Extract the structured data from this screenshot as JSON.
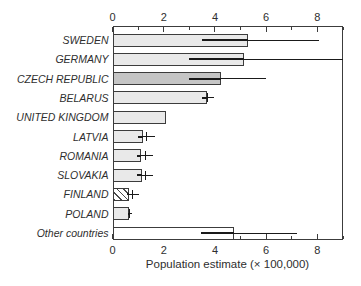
{
  "figure": {
    "background": "#ffffff"
  },
  "chart_data": {
    "type": "bar",
    "orientation": "horizontal",
    "title": "",
    "xlabel": "Population estimate (× 100,000)",
    "xlim": [
      0,
      9
    ],
    "xticks_major": [
      0,
      2,
      4,
      6,
      8
    ],
    "xticks_minor": [
      1,
      3,
      5,
      7,
      9
    ],
    "grid": false,
    "legend": "none",
    "axis_style": "full box, tick marks inside on top and bottom axes, tick labels on both top and bottom",
    "categories": [
      "SWEDEN",
      "GERMANY",
      "CZECH REPUBLIC",
      "BELARUS",
      "UNITED KINGDOM",
      "LATVIA",
      "ROMANIA",
      "SLOVAKIA",
      "FINLAND",
      "POLAND",
      "Other countries"
    ],
    "values": [
      5.3,
      5.15,
      4.25,
      3.7,
      2.1,
      1.2,
      1.1,
      1.15,
      0.65,
      0.65,
      4.75
    ],
    "error_low": [
      3.5,
      3.0,
      3.0,
      3.5,
      null,
      1.0,
      0.95,
      0.95,
      0.55,
      0.6,
      3.45
    ],
    "error_high": [
      8.05,
      9.0,
      6.0,
      3.95,
      null,
      1.65,
      1.6,
      1.6,
      1.05,
      0.75,
      7.2
    ],
    "error_center_tick": [
      null,
      null,
      null,
      3.72,
      null,
      1.33,
      1.28,
      1.3,
      0.8,
      0.68,
      null
    ],
    "bar_styles": [
      "light",
      "light",
      "dark",
      "light",
      "light",
      "light",
      "light",
      "light",
      "hatched",
      "light",
      "white"
    ],
    "colors": {
      "bar_light": "#e9e9e9",
      "bar_dark": "#c5c5c5",
      "bar_white": "#ffffff",
      "bar_hatch_stripe": "#4a4a4a",
      "bar_border": "#3c3c3c",
      "error_line": "#1a1a1a",
      "axis_line": "#3c3c3c",
      "text": "#2e2e2e"
    }
  }
}
